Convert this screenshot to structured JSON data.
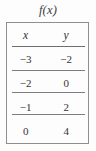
{
  "figure": {
    "title": "f(x)"
  },
  "table": {
    "headers": [
      "x",
      "y"
    ],
    "rows": [
      {
        "x": "−3",
        "y": "−2"
      },
      {
        "x": "−2",
        "y": "0"
      },
      {
        "x": "−1",
        "y": "2"
      },
      {
        "x": "0",
        "y": "4"
      }
    ]
  },
  "chart_data": {
    "type": "table",
    "title": "f(x)",
    "columns": [
      "x",
      "y"
    ],
    "x": [
      -3,
      -2,
      -1,
      0
    ],
    "values": [
      -2,
      0,
      2,
      4
    ],
    "rows": [
      [
        -3,
        -2
      ],
      [
        -2,
        0
      ],
      [
        -1,
        2
      ],
      [
        0,
        4
      ]
    ],
    "xlabel": "x",
    "ylabel": "y"
  },
  "style": {
    "border_color": "#8f8f8f",
    "rule_color": "#6e6e6e",
    "text_color": "#333333",
    "background": "#fdfdfd"
  }
}
